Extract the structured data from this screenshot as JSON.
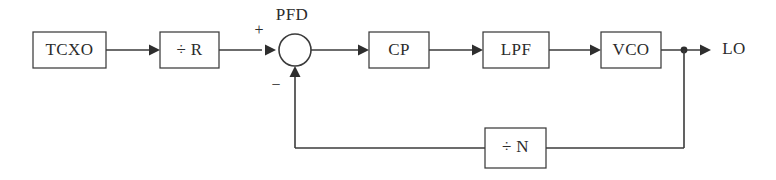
{
  "diagram": {
    "type": "block-diagram",
    "canvas": {
      "width": 776,
      "height": 180
    },
    "colors": {
      "background": "#ffffff",
      "line": "#3b3b3b",
      "text": "#2b2b2b",
      "arrow_fill": "#2e2e2e"
    },
    "blocks": [
      {
        "id": "tcxo",
        "label": "TCXO",
        "x": 33,
        "y": 32,
        "w": 73,
        "h": 36
      },
      {
        "id": "div_r",
        "label": "÷ R",
        "x": 160,
        "y": 32,
        "w": 59,
        "h": 36
      },
      {
        "id": "cp",
        "label": "CP",
        "x": 369,
        "y": 32,
        "w": 60,
        "h": 36
      },
      {
        "id": "lpf",
        "label": "LPF",
        "x": 483,
        "y": 32,
        "w": 66,
        "h": 36
      },
      {
        "id": "vco",
        "label": "VCO",
        "x": 601,
        "y": 32,
        "w": 60,
        "h": 36
      },
      {
        "id": "div_n",
        "label": "÷ N",
        "x": 485,
        "y": 128,
        "w": 61,
        "h": 40
      }
    ],
    "summing_junction": {
      "id": "pfd",
      "label": "PFD",
      "cx": 295,
      "cy": 50,
      "r": 16,
      "plus_sign": "+",
      "minus_sign": "−"
    },
    "output": {
      "id": "lo",
      "label": "LO"
    },
    "signal_path_order": [
      "TCXO",
      "÷ R",
      "PFD",
      "CP",
      "LPF",
      "VCO",
      "LO"
    ],
    "feedback_path_order": [
      "VCO",
      "÷ N",
      "PFD"
    ]
  }
}
